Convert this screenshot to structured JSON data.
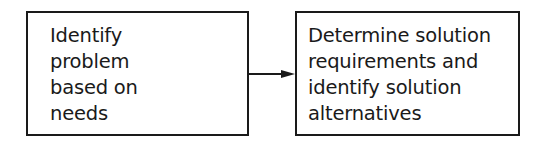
{
  "diagram": {
    "nodes": [
      {
        "id": "step1",
        "text": "Identify\nproblem\nbased on\nneeds"
      },
      {
        "id": "step2",
        "text": "Determine solution\nrequirements and\nidentify solution\nalternatives"
      }
    ],
    "edges": [
      {
        "from": "step1",
        "to": "step2"
      }
    ]
  }
}
